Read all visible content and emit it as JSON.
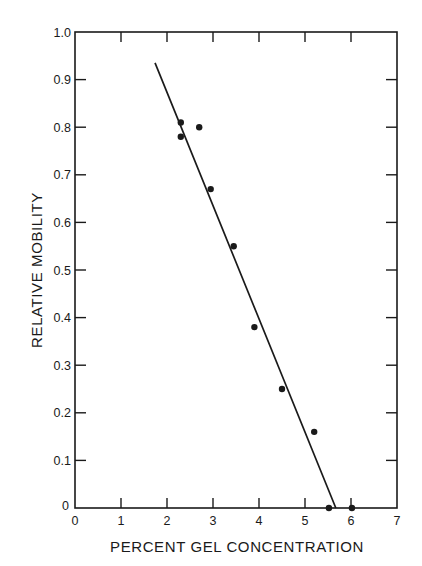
{
  "chart_data": {
    "type": "scatter",
    "title": "",
    "xlabel": "PERCENT GEL CONCENTRATION",
    "ylabel": "RELATIVE MOBILITY",
    "xlim": [
      0,
      7
    ],
    "ylim": [
      0,
      1.0
    ],
    "x_ticks": [
      "0",
      "1",
      "2",
      "3",
      "4",
      "5",
      "6",
      "7"
    ],
    "y_ticks": [
      "0",
      "0.1",
      "0.2",
      "0.3",
      "0.4",
      "0.5",
      "0.6",
      "0.7",
      "0.8",
      "0.9",
      "1.0"
    ],
    "grid": false,
    "legend": null,
    "series": [
      {
        "name": "Measured points",
        "kind": "scatter",
        "points": [
          {
            "x": 2.3,
            "y": 0.81
          },
          {
            "x": 2.3,
            "y": 0.78
          },
          {
            "x": 2.7,
            "y": 0.8
          },
          {
            "x": 2.95,
            "y": 0.67
          },
          {
            "x": 3.45,
            "y": 0.55
          },
          {
            "x": 3.9,
            "y": 0.38
          },
          {
            "x": 4.5,
            "y": 0.25
          },
          {
            "x": 5.2,
            "y": 0.16
          },
          {
            "x": 5.52,
            "y": 0.0
          },
          {
            "x": 6.02,
            "y": 0.0
          }
        ]
      },
      {
        "name": "Linear fit",
        "kind": "line",
        "points": [
          {
            "x": 1.74,
            "y": 0.935
          },
          {
            "x": 5.67,
            "y": 0.0
          }
        ]
      }
    ]
  },
  "colors": {
    "ink": "#1a1a1a",
    "background": "#ffffff"
  }
}
